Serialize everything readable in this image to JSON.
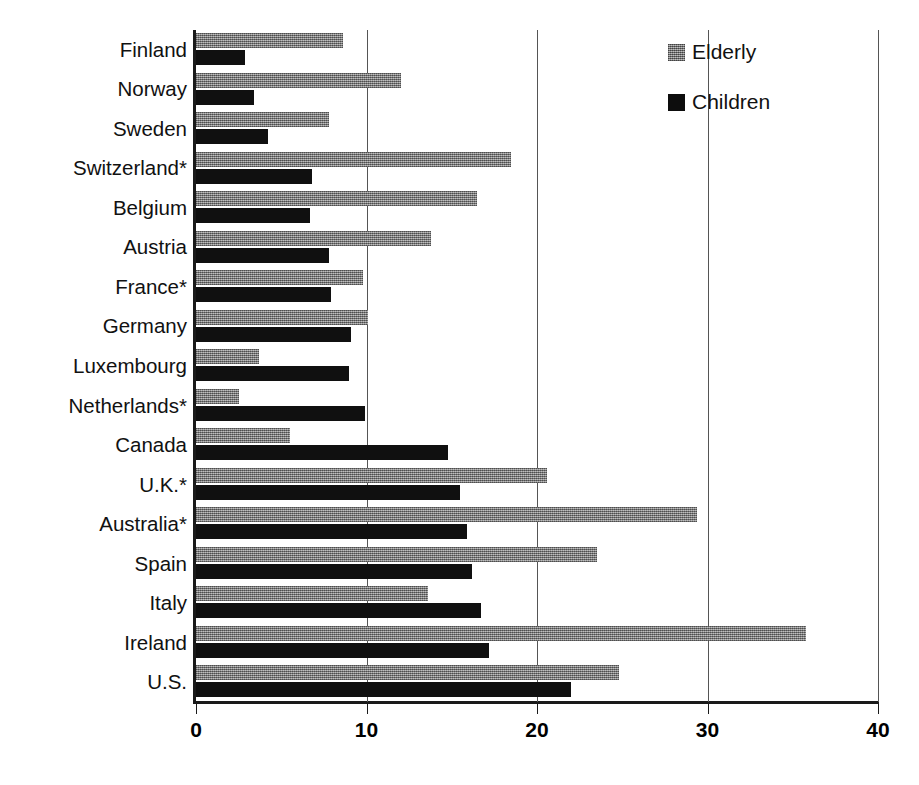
{
  "title_fragment": "",
  "legend": {
    "position": "top-right",
    "entries": [
      {
        "label": "Elderly",
        "color": "#8a8a8a",
        "icon": "square-swatch-icon"
      },
      {
        "label": "Children",
        "color": "#0d0d0d",
        "icon": "square-swatch-icon"
      }
    ]
  },
  "axis": {
    "x_ticks": [
      "0",
      "10",
      "20",
      "30",
      "40"
    ],
    "x_tick_values": [
      0,
      10,
      20,
      30,
      40
    ]
  },
  "chart_data": {
    "type": "bar",
    "orientation": "horizontal",
    "title": "",
    "xlabel": "",
    "ylabel": "",
    "xlim": [
      0,
      40
    ],
    "grid": true,
    "legend_position": "top-right",
    "categories": [
      "Finland",
      "Norway",
      "Sweden",
      "Switzerland*",
      "Belgium",
      "Austria",
      "France*",
      "Germany",
      "Luxembourg",
      "Netherlands*",
      "Canada",
      "U.K.*",
      "Australia*",
      "Spain",
      "Italy",
      "Ireland",
      "U.S."
    ],
    "series": [
      {
        "name": "Elderly",
        "color": "#8a8a8a",
        "values": [
          8.6,
          12.0,
          7.8,
          18.5,
          16.5,
          13.8,
          9.8,
          10.1,
          3.7,
          2.5,
          5.5,
          20.6,
          29.4,
          23.5,
          13.6,
          35.8,
          24.8
        ]
      },
      {
        "name": "Children",
        "color": "#0d0d0d",
        "values": [
          2.9,
          3.4,
          4.2,
          6.8,
          6.7,
          7.8,
          7.9,
          9.1,
          9.0,
          9.9,
          14.8,
          15.5,
          15.9,
          16.2,
          16.7,
          17.2,
          22.0
        ]
      }
    ]
  }
}
